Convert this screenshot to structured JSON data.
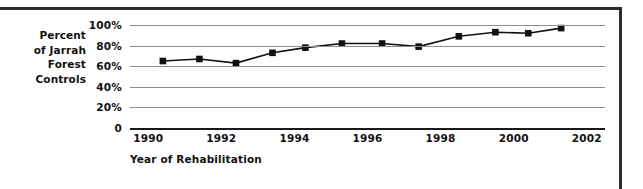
{
  "chart_data": {
    "type": "line",
    "title": "",
    "ylabel": "Percent of Jarrah Forest Controls",
    "ylabel_lines": [
      "Percent",
      "of Jarrah",
      "Forest",
      "Controls"
    ],
    "xlabel": "Year of Rehabilitation",
    "x": [
      1990.4,
      1991.4,
      1992.4,
      1993.4,
      1994.3,
      1995.3,
      1996.4,
      1997.4,
      1998.5,
      1999.5,
      2000.4,
      2001.3
    ],
    "values": [
      65,
      67,
      63,
      73,
      78,
      82,
      82,
      79,
      89,
      93,
      92,
      97
    ],
    "xlim": [
      1989.5,
      2002.5
    ],
    "ylim": [
      0,
      100
    ],
    "yticks": [
      0,
      20,
      40,
      60,
      80,
      100
    ],
    "ytick_labels": [
      "0",
      "20%",
      "40%",
      "60%",
      "80%",
      "100%"
    ],
    "xticks": [
      1990,
      1992,
      1994,
      1996,
      1998,
      2000,
      2002
    ],
    "xtick_labels": [
      "1990",
      "1992",
      "1994",
      "1996",
      "1998",
      "2000",
      "2002"
    ],
    "grid": true,
    "legend": "none",
    "marker": "square",
    "marker_color": "#111111",
    "line_color": "#111111"
  },
  "colors": {
    "line": "#111111",
    "marker": "#111111",
    "grid": "#8d8d8d",
    "axis": "#1a1a1a",
    "rule": "#2b2b2b",
    "text": "#111111"
  }
}
